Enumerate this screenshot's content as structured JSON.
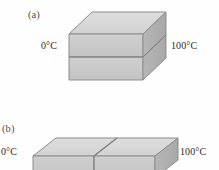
{
  "figure": {
    "panels": [
      {
        "tag": "(a)",
        "kind": "stacked-slab-3d-box",
        "left_temperature": "0°C",
        "right_temperature": "100°C",
        "layers": 2,
        "division": "horizontal"
      },
      {
        "tag": "(b)",
        "kind": "side-by-side-slab-3d-box",
        "left_temperature": "0°C",
        "right_temperature": "100°C",
        "layers": 2,
        "division": "vertical"
      }
    ],
    "colors": {
      "top_face": "#d7d7d7",
      "front_face": "#c9c9c9",
      "side_face": "#b0b0b0",
      "outline": "#8a8a8a",
      "background": "#fefefe",
      "text": "#2f2b2c"
    }
  }
}
